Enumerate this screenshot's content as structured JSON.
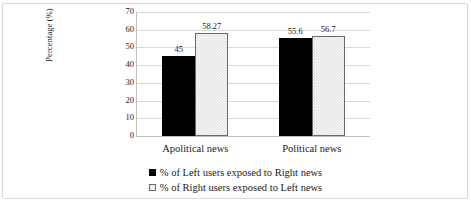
{
  "chart_data": {
    "type": "bar",
    "title": "",
    "xlabel": "",
    "ylabel": "Percentage (%)",
    "categories": [
      "Apolitical news",
      "Political news"
    ],
    "series": [
      {
        "name": "% of Left users exposed to Right news",
        "values": [
          45,
          55.6
        ],
        "labels": [
          "45",
          "55.6"
        ],
        "color": "#000000",
        "pattern": "solid"
      },
      {
        "name": "% of Right users exposed to Left news",
        "values": [
          58.27,
          56.7
        ],
        "labels": [
          "58.27",
          "56.7"
        ],
        "color": "#e2e2e2",
        "pattern": "checkered"
      }
    ],
    "ylim": [
      0,
      70
    ],
    "yticks": [
      "0",
      "10",
      "20",
      "30",
      "40",
      "50",
      "60",
      "70"
    ],
    "grid": true,
    "legend_position": "bottom"
  }
}
